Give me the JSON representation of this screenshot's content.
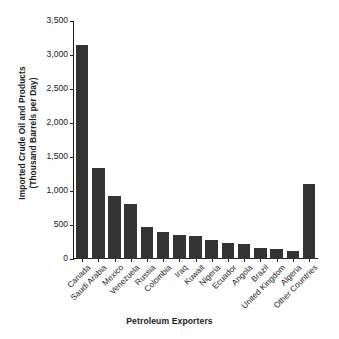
{
  "chart_data": {
    "type": "bar",
    "title": "",
    "xlabel": "Petroleum Exporters",
    "ylabel_line1": "Imported Crude Oil and Products",
    "ylabel_line2": "(Thousand Barrels per Day)",
    "ylabel": "Imported Crude Oil and Products (Thousand Barrels per Day)",
    "categories": [
      "Canada",
      "Saudi Arabia",
      "Mexico",
      "Venezuela",
      "Russia",
      "Colombia",
      "Iraq",
      "Kuwait",
      "Nigeria",
      "Ecuador",
      "Angola",
      "Brazil",
      "United Kingdom",
      "Algeria",
      "Other Countries"
    ],
    "values": [
      3140,
      1330,
      920,
      810,
      460,
      390,
      345,
      330,
      280,
      235,
      215,
      150,
      140,
      115,
      1105
    ],
    "ylim": [
      0,
      3500
    ],
    "ytick_values": [
      0,
      500,
      1000,
      1500,
      2000,
      2500,
      3000,
      3500
    ],
    "ytick_labels": [
      "0",
      "500",
      "1,000",
      "1,500",
      "2,000",
      "2,500",
      "3,000",
      "3,500"
    ],
    "grid": false,
    "legend": false,
    "bar_color": "#333333",
    "axis_color": "#1a1a1a",
    "background_color": "#ffffff"
  }
}
